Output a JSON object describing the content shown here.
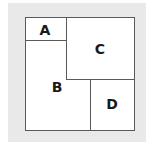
{
  "diagram": {
    "regions": [
      {
        "id": "A",
        "label": "A"
      },
      {
        "id": "B",
        "label": "B"
      },
      {
        "id": "C",
        "label": "C"
      },
      {
        "id": "D",
        "label": "D"
      }
    ],
    "colors": {
      "background": "#e9e9e9",
      "fill": "#ffffff",
      "stroke": "#5a5a5a",
      "text": "#1a1a1a"
    }
  }
}
